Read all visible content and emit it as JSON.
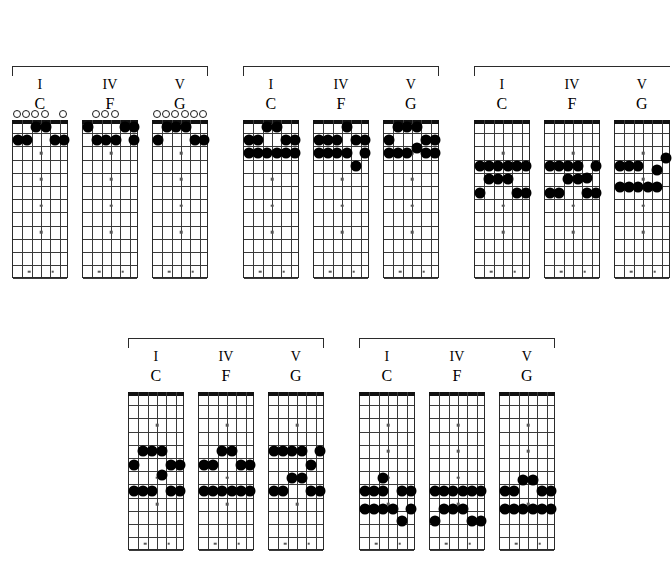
{
  "page": {
    "background_color": "#ffffff",
    "dot_color": "#000000",
    "line_color": "#3a3a3a",
    "nut_color": "#111111"
  },
  "labels": {
    "degree_I": "I",
    "degree_IV": "IV",
    "degree_V": "V",
    "chord_C": "C",
    "chord_F": "F",
    "chord_G": "G"
  },
  "neck": {
    "strings": 6,
    "frets": 12,
    "inlay_frets": [
      3,
      5,
      7,
      9,
      12,
      15
    ],
    "double_inlay_frets": [
      12
    ]
  },
  "groups": [
    {
      "id": "group-1",
      "name": "open-position-voicings",
      "x": 12,
      "y": 66,
      "width": 196,
      "bracket_height": 10,
      "chords": [
        {
          "id": "g1-c",
          "degree": "I",
          "name": "C",
          "x": 0,
          "width": 56,
          "open_strings": [
            1,
            2,
            3,
            4,
            6
          ],
          "muted_strings": [],
          "dots": [
            {
              "string": 1,
              "fret": 2
            },
            {
              "string": 2,
              "fret": 2
            },
            {
              "string": 3,
              "fret": 1
            },
            {
              "string": 4,
              "fret": 1
            },
            {
              "string": 5,
              "fret": 2
            },
            {
              "string": 6,
              "fret": 2
            }
          ]
        },
        {
          "id": "g1-f",
          "degree": "IV",
          "name": "F",
          "x": 70,
          "width": 56,
          "open_strings": [
            2,
            3,
            4
          ],
          "muted_strings": [],
          "dots": [
            {
              "string": 1,
              "fret": 1
            },
            {
              "string": 2,
              "fret": 2
            },
            {
              "string": 3,
              "fret": 2
            },
            {
              "string": 4,
              "fret": 2
            },
            {
              "string": 5,
              "fret": 1
            },
            {
              "string": 6,
              "fret": 2
            },
            {
              "string": 6,
              "fret": 1
            }
          ]
        },
        {
          "id": "g1-g",
          "degree": "V",
          "name": "G",
          "x": 140,
          "width": 56,
          "open_strings": [
            1,
            2,
            3,
            4,
            5,
            6
          ],
          "muted_strings": [],
          "dots": [
            {
              "string": 1,
              "fret": 2
            },
            {
              "string": 2,
              "fret": 1
            },
            {
              "string": 3,
              "fret": 1
            },
            {
              "string": 4,
              "fret": 1
            },
            {
              "string": 5,
              "fret": 2
            },
            {
              "string": 6,
              "fret": 2
            }
          ]
        }
      ]
    },
    {
      "id": "group-2",
      "name": "barre-voicings-low",
      "x": 243,
      "y": 66,
      "width": 196,
      "bracket_height": 10,
      "chords": [
        {
          "id": "g2-c",
          "degree": "I",
          "name": "C",
          "x": 0,
          "width": 56,
          "open_strings": [],
          "muted_strings": [],
          "dots": [
            {
              "string": 1,
              "fret": 2
            },
            {
              "string": 2,
              "fret": 2
            },
            {
              "string": 3,
              "fret": 1
            },
            {
              "string": 4,
              "fret": 1
            },
            {
              "string": 5,
              "fret": 2
            },
            {
              "string": 6,
              "fret": 2
            },
            {
              "string": 1,
              "fret": 3
            },
            {
              "string": 2,
              "fret": 3
            },
            {
              "string": 3,
              "fret": 3
            },
            {
              "string": 4,
              "fret": 3
            },
            {
              "string": 5,
              "fret": 3
            },
            {
              "string": 6,
              "fret": 3
            }
          ]
        },
        {
          "id": "g2-f",
          "degree": "IV",
          "name": "F",
          "x": 70,
          "width": 56,
          "open_strings": [],
          "muted_strings": [],
          "dots": [
            {
              "string": 1,
              "fret": 2
            },
            {
              "string": 2,
              "fret": 2
            },
            {
              "string": 3,
              "fret": 2
            },
            {
              "string": 4,
              "fret": 1
            },
            {
              "string": 5,
              "fret": 2
            },
            {
              "string": 6,
              "fret": 2
            },
            {
              "string": 1,
              "fret": 3
            },
            {
              "string": 2,
              "fret": 3
            },
            {
              "string": 3,
              "fret": 3
            },
            {
              "string": 4,
              "fret": 3
            },
            {
              "string": 6,
              "fret": 3
            },
            {
              "string": 5,
              "fret": 4
            }
          ]
        },
        {
          "id": "g2-g",
          "degree": "V",
          "name": "G",
          "x": 140,
          "width": 56,
          "open_strings": [],
          "muted_strings": [],
          "dots": [
            {
              "string": 2,
              "fret": 1
            },
            {
              "string": 3,
              "fret": 1
            },
            {
              "string": 4,
              "fret": 1
            },
            {
              "string": 1,
              "fret": 2
            },
            {
              "string": 5,
              "fret": 2
            },
            {
              "string": 6,
              "fret": 2
            },
            {
              "string": 4,
              "fret": 2.6
            },
            {
              "string": 1,
              "fret": 3
            },
            {
              "string": 2,
              "fret": 3
            },
            {
              "string": 3,
              "fret": 3
            },
            {
              "string": 5,
              "fret": 3
            },
            {
              "string": 6,
              "fret": 3
            }
          ]
        }
      ]
    },
    {
      "id": "group-3",
      "name": "mid-neck-voicings",
      "x": 474,
      "y": 66,
      "width": 196,
      "bracket_height": 10,
      "clipped_right": true,
      "chords": [
        {
          "id": "g3-c",
          "degree": "I",
          "name": "C",
          "x": 0,
          "width": 56,
          "open_strings": [],
          "muted_strings": [],
          "dots": [
            {
              "string": 1,
              "fret": 4
            },
            {
              "string": 2,
              "fret": 4
            },
            {
              "string": 3,
              "fret": 4
            },
            {
              "string": 4,
              "fret": 4
            },
            {
              "string": 5,
              "fret": 4
            },
            {
              "string": 6,
              "fret": 4
            },
            {
              "string": 2,
              "fret": 5
            },
            {
              "string": 3,
              "fret": 5
            },
            {
              "string": 4,
              "fret": 5
            },
            {
              "string": 1,
              "fret": 6
            },
            {
              "string": 5,
              "fret": 6
            },
            {
              "string": 6,
              "fret": 6
            }
          ]
        },
        {
          "id": "g3-f",
          "degree": "IV",
          "name": "F",
          "x": 70,
          "width": 56,
          "open_strings": [],
          "muted_strings": [],
          "dots": [
            {
              "string": 1,
              "fret": 4
            },
            {
              "string": 2,
              "fret": 4
            },
            {
              "string": 3,
              "fret": 4
            },
            {
              "string": 4,
              "fret": 4
            },
            {
              "string": 6,
              "fret": 4
            },
            {
              "string": 5,
              "fret": 4.9
            },
            {
              "string": 3,
              "fret": 5
            },
            {
              "string": 4,
              "fret": 5
            },
            {
              "string": 1,
              "fret": 6
            },
            {
              "string": 2,
              "fret": 6
            },
            {
              "string": 5,
              "fret": 6
            },
            {
              "string": 6,
              "fret": 6
            }
          ]
        },
        {
          "id": "g3-g",
          "degree": "V",
          "name": "G",
          "x": 140,
          "width": 56,
          "open_strings": [],
          "muted_strings": [],
          "dots": [
            {
              "string": 6,
              "fret": 3.4
            },
            {
              "string": 1,
              "fret": 4
            },
            {
              "string": 2,
              "fret": 4
            },
            {
              "string": 3,
              "fret": 4
            },
            {
              "string": 5,
              "fret": 4.3
            },
            {
              "string": 1,
              "fret": 5.6
            },
            {
              "string": 2,
              "fret": 5.6
            },
            {
              "string": 3,
              "fret": 5.6
            },
            {
              "string": 4,
              "fret": 5.6
            },
            {
              "string": 5,
              "fret": 5.6
            }
          ]
        }
      ]
    },
    {
      "id": "group-4",
      "name": "upper-neck-voicings",
      "x": 128,
      "y": 338,
      "width": 196,
      "bracket_height": 10,
      "chords": [
        {
          "id": "g4-c",
          "degree": "I",
          "name": "C",
          "x": 0,
          "width": 56,
          "open_strings": [],
          "muted_strings": [],
          "dots": [
            {
              "string": 2,
              "fret": 5
            },
            {
              "string": 3,
              "fret": 5
            },
            {
              "string": 4,
              "fret": 5
            },
            {
              "string": 1,
              "fret": 6
            },
            {
              "string": 5,
              "fret": 6
            },
            {
              "string": 6,
              "fret": 6
            },
            {
              "string": 4,
              "fret": 6.8
            },
            {
              "string": 1,
              "fret": 8
            },
            {
              "string": 2,
              "fret": 8
            },
            {
              "string": 3,
              "fret": 8
            },
            {
              "string": 5,
              "fret": 8
            },
            {
              "string": 6,
              "fret": 8
            }
          ]
        },
        {
          "id": "g4-f",
          "degree": "IV",
          "name": "F",
          "x": 70,
          "width": 56,
          "open_strings": [],
          "muted_strings": [],
          "dots": [
            {
              "string": 3,
              "fret": 5
            },
            {
              "string": 4,
              "fret": 5
            },
            {
              "string": 1,
              "fret": 6
            },
            {
              "string": 2,
              "fret": 6
            },
            {
              "string": 5,
              "fret": 6
            },
            {
              "string": 6,
              "fret": 6
            },
            {
              "string": 1,
              "fret": 8
            },
            {
              "string": 2,
              "fret": 8
            },
            {
              "string": 3,
              "fret": 8
            },
            {
              "string": 4,
              "fret": 8
            },
            {
              "string": 5,
              "fret": 8
            },
            {
              "string": 6,
              "fret": 8
            }
          ]
        },
        {
          "id": "g4-g",
          "degree": "V",
          "name": "G",
          "x": 140,
          "width": 56,
          "open_strings": [],
          "muted_strings": [],
          "dots": [
            {
              "string": 1,
              "fret": 5
            },
            {
              "string": 2,
              "fret": 5
            },
            {
              "string": 3,
              "fret": 5
            },
            {
              "string": 4,
              "fret": 5
            },
            {
              "string": 6,
              "fret": 5
            },
            {
              "string": 5,
              "fret": 6
            },
            {
              "string": 3,
              "fret": 7
            },
            {
              "string": 4,
              "fret": 7
            },
            {
              "string": 1,
              "fret": 8
            },
            {
              "string": 2,
              "fret": 8
            },
            {
              "string": 5,
              "fret": 8
            },
            {
              "string": 6,
              "fret": 8
            }
          ]
        }
      ]
    },
    {
      "id": "group-5",
      "name": "high-neck-voicings",
      "x": 359,
      "y": 338,
      "width": 196,
      "bracket_height": 10,
      "chords": [
        {
          "id": "g5-c",
          "degree": "I",
          "name": "C",
          "x": 0,
          "width": 56,
          "open_strings": [],
          "muted_strings": [],
          "dots": [
            {
              "string": 3,
              "fret": 7
            },
            {
              "string": 1,
              "fret": 8
            },
            {
              "string": 2,
              "fret": 8
            },
            {
              "string": 3,
              "fret": 8
            },
            {
              "string": 5,
              "fret": 8
            },
            {
              "string": 6,
              "fret": 8
            },
            {
              "string": 1,
              "fret": 9.4
            },
            {
              "string": 2,
              "fret": 9.4
            },
            {
              "string": 3,
              "fret": 9.4
            },
            {
              "string": 4,
              "fret": 9.4
            },
            {
              "string": 6,
              "fret": 9.4
            },
            {
              "string": 5,
              "fret": 10.3
            }
          ]
        },
        {
          "id": "g5-f",
          "degree": "IV",
          "name": "F",
          "x": 70,
          "width": 56,
          "open_strings": [],
          "muted_strings": [],
          "dots": [
            {
              "string": 1,
              "fret": 8
            },
            {
              "string": 2,
              "fret": 8
            },
            {
              "string": 3,
              "fret": 8
            },
            {
              "string": 4,
              "fret": 8
            },
            {
              "string": 5,
              "fret": 8
            },
            {
              "string": 6,
              "fret": 8
            },
            {
              "string": 2,
              "fret": 9.4
            },
            {
              "string": 3,
              "fret": 9.4
            },
            {
              "string": 4,
              "fret": 9.4
            },
            {
              "string": 1,
              "fret": 10.3
            },
            {
              "string": 5,
              "fret": 10.3
            },
            {
              "string": 6,
              "fret": 10.3
            }
          ]
        },
        {
          "id": "g5-g",
          "degree": "V",
          "name": "G",
          "x": 140,
          "width": 56,
          "open_strings": [],
          "muted_strings": [],
          "dots": [
            {
              "string": 3,
              "fret": 7.2
            },
            {
              "string": 4,
              "fret": 7.2
            },
            {
              "string": 1,
              "fret": 8
            },
            {
              "string": 2,
              "fret": 8
            },
            {
              "string": 5,
              "fret": 8
            },
            {
              "string": 6,
              "fret": 8
            },
            {
              "string": 1,
              "fret": 9.4
            },
            {
              "string": 2,
              "fret": 9.4
            },
            {
              "string": 3,
              "fret": 9.4
            },
            {
              "string": 4,
              "fret": 9.4
            },
            {
              "string": 5,
              "fret": 9.4
            },
            {
              "string": 6,
              "fret": 9.4
            }
          ]
        }
      ]
    }
  ]
}
